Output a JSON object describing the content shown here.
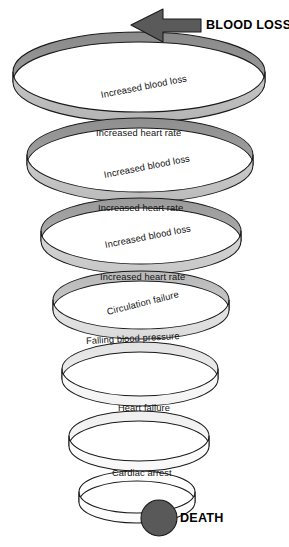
{
  "diagram": {
    "title_callout": "BLOOD LOSS",
    "end_callout": "DEATH",
    "arrow_icon": "arrow-left-icon",
    "death_node_icon": "filled-circle-icon",
    "colors": {
      "arrow_fill": "#5a5a5a",
      "death_circle_fill": "#595959",
      "outline": "#1a1a1a",
      "ribbon_top_dark": "#8e8e8e",
      "ribbon_top_light": "#c2c2c2",
      "ribbon_bottom_dark": "#e8e8e8",
      "ribbon_bottom_light": "#fdfdfd",
      "background": "#ffffff"
    },
    "steps": [
      {
        "label": "Increased blood loss",
        "face": "back",
        "coil": 1
      },
      {
        "label": "Increased heart rate",
        "face": "front",
        "coil": 1
      },
      {
        "label": "Increased blood loss",
        "face": "back",
        "coil": 2
      },
      {
        "label": "Increased heart rate",
        "face": "front",
        "coil": 2
      },
      {
        "label": "Increased blood loss",
        "face": "back",
        "coil": 3
      },
      {
        "label": "Increased heart rate",
        "face": "front",
        "coil": 3
      },
      {
        "label": "Circulation failure",
        "face": "back",
        "coil": 4
      },
      {
        "label": "Falling blood pressure",
        "face": "front",
        "coil": 4
      },
      {
        "label": "Heart failure",
        "face": "front",
        "coil": 5
      },
      {
        "label": "Cardiac arrest",
        "face": "front",
        "coil": 6
      }
    ]
  }
}
